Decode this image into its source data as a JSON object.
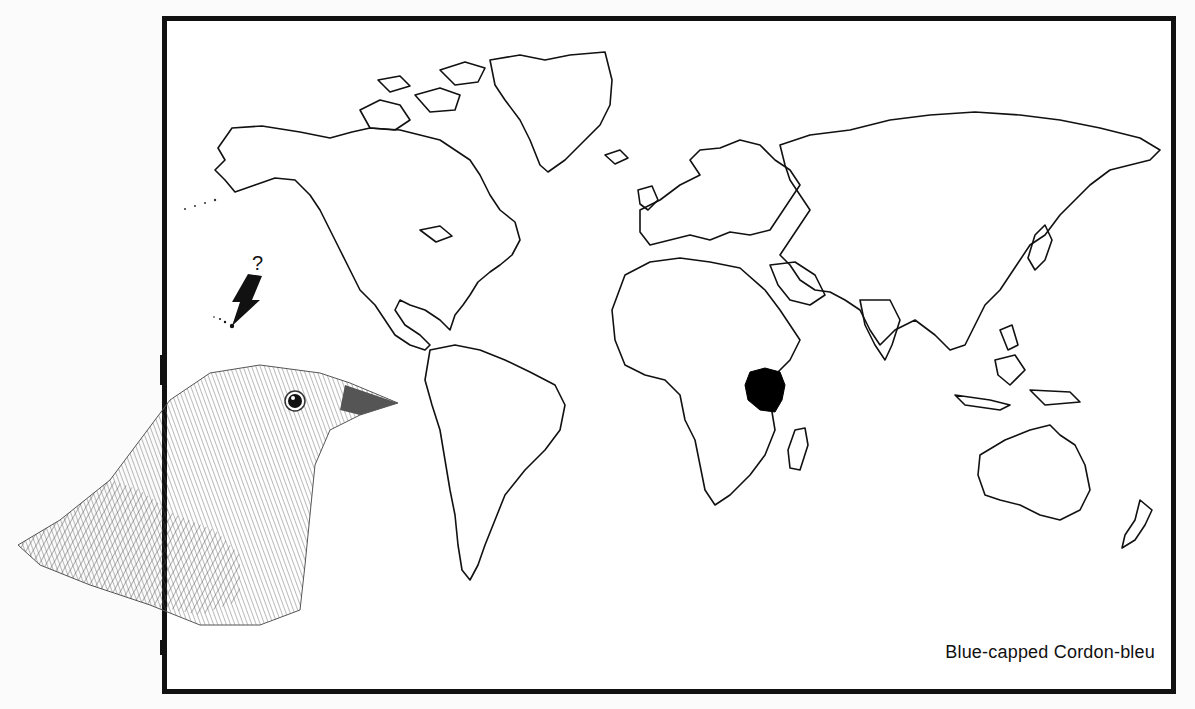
{
  "map": {
    "caption": "Blue-capped Cordon-bleu",
    "range_label": "native-range",
    "range_region": "East Africa (Kenya / Tanzania)",
    "annotation": {
      "symbol": "?",
      "target": "Hawaiian Islands",
      "meaning": "uncertain introduced population"
    },
    "colors": {
      "frame": "#111111",
      "coastline": "#111111",
      "range_fill": "#000000",
      "background": "#ffffff"
    }
  },
  "illustration": {
    "subject": "bird-head-sketch"
  }
}
